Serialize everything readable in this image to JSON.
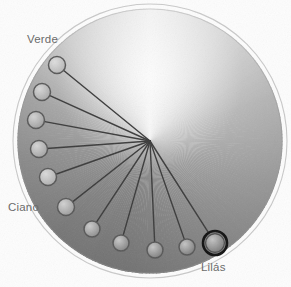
{
  "figure": {
    "type": "color-wheel-node-diagram",
    "title": "",
    "background_color": "#fdfdfd",
    "canvas": {
      "width": 291,
      "height": 287
    }
  },
  "wheel": {
    "name": "gradient-color-disc",
    "center_x": 150,
    "center_y": 141,
    "radius": 132,
    "outer_ring_radius": 137,
    "outer_ring_color": "#c9c9c9",
    "gradient_type": "conic",
    "gradient_stops": [
      {
        "angle_deg": 0,
        "color": "#efefef"
      },
      {
        "angle_deg": 35,
        "color": "#cfcfcf"
      },
      {
        "angle_deg": 70,
        "color": "#a9a9a9"
      },
      {
        "angle_deg": 110,
        "color": "#8e8e8e"
      },
      {
        "angle_deg": 150,
        "color": "#7c7c7c"
      },
      {
        "angle_deg": 190,
        "color": "#6f6f6f"
      },
      {
        "angle_deg": 225,
        "color": "#707070"
      },
      {
        "angle_deg": 260,
        "color": "#7e7e7e"
      },
      {
        "angle_deg": 290,
        "color": "#949494"
      },
      {
        "angle_deg": 320,
        "color": "#c2c2c2"
      },
      {
        "angle_deg": 360,
        "color": "#efefef"
      }
    ]
  },
  "hub": {
    "name": "center-hub",
    "x": 150,
    "y": 141,
    "spoke_color": "#3b3b3b",
    "spoke_width": 1.4
  },
  "nodes": [
    {
      "id": "node-1",
      "label": "Verde",
      "x": 57,
      "y": 65,
      "r": 8.5,
      "fill": "#b6b6b6",
      "stroke": "#585858",
      "highlighted": false
    },
    {
      "id": "node-2",
      "label": "",
      "x": 42,
      "y": 92,
      "r": 8.5,
      "fill": "#a8a8a8",
      "stroke": "#585858",
      "highlighted": false
    },
    {
      "id": "node-3",
      "label": "",
      "x": 36,
      "y": 120,
      "r": 8.5,
      "fill": "#9e9e9e",
      "stroke": "#585858",
      "highlighted": false
    },
    {
      "id": "node-4",
      "label": "",
      "x": 39,
      "y": 149,
      "r": 8.5,
      "fill": "#a3a3a3",
      "stroke": "#585858",
      "highlighted": false
    },
    {
      "id": "node-5",
      "label": "",
      "x": 48,
      "y": 177,
      "r": 8.5,
      "fill": "#aeaeae",
      "stroke": "#585858",
      "highlighted": false
    },
    {
      "id": "node-6",
      "label": "Ciano",
      "x": 66,
      "y": 207,
      "r": 8.5,
      "fill": "#9b9b9b",
      "stroke": "#585858",
      "highlighted": false
    },
    {
      "id": "node-7",
      "label": "",
      "x": 92,
      "y": 229,
      "r": 8.0,
      "fill": "#8d8d8d",
      "stroke": "#585858",
      "highlighted": false
    },
    {
      "id": "node-8",
      "label": "",
      "x": 121,
      "y": 243,
      "r": 8.0,
      "fill": "#848484",
      "stroke": "#585858",
      "highlighted": false
    },
    {
      "id": "node-9",
      "label": "",
      "x": 155,
      "y": 250,
      "r": 8.0,
      "fill": "#7f7f7f",
      "stroke": "#585858",
      "highlighted": false
    },
    {
      "id": "node-10",
      "label": "",
      "x": 187,
      "y": 247,
      "r": 8.0,
      "fill": "#7d7d7d",
      "stroke": "#585858",
      "highlighted": false
    },
    {
      "id": "node-11",
      "label": "Lilás",
      "x": 215,
      "y": 243,
      "r": 12.0,
      "fill": "#7a7a7a",
      "stroke": "#111111",
      "highlighted": true
    }
  ],
  "labels": {
    "verde": {
      "text": "Verde",
      "x": 27,
      "y": 34,
      "color": "#6b6b6b"
    },
    "ciano": {
      "text": "Ciano",
      "x": 8,
      "y": 202,
      "color": "#6b6b6b"
    },
    "lilas": {
      "text": "Lilás",
      "x": 201,
      "y": 262,
      "color": "#6b6b6b"
    }
  }
}
